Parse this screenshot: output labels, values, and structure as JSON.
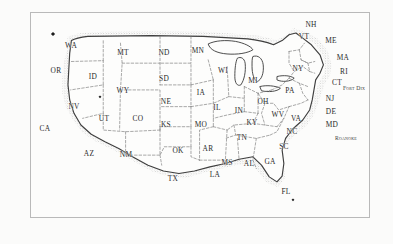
{
  "figure": {
    "kind": "map",
    "region": "Contiguous United States",
    "style": "pen-and-ink stippled coastline with dashed state borders",
    "background_color": "#fbfbfa",
    "frame_color": "#b9b9b9",
    "ink_color": "#2b2b2b",
    "coast_color": "#4a4a4a"
  },
  "states": [
    {
      "abbr": "WA",
      "x": 70,
      "y": 45
    },
    {
      "abbr": "OR",
      "x": 55,
      "y": 70
    },
    {
      "abbr": "ID",
      "x": 92,
      "y": 76
    },
    {
      "abbr": "MT",
      "x": 122,
      "y": 52
    },
    {
      "abbr": "ND",
      "x": 163,
      "y": 52
    },
    {
      "abbr": "MN",
      "x": 197,
      "y": 50
    },
    {
      "abbr": "SD",
      "x": 163,
      "y": 78
    },
    {
      "abbr": "WY",
      "x": 122,
      "y": 90
    },
    {
      "abbr": "NV",
      "x": 73,
      "y": 106
    },
    {
      "abbr": "UT",
      "x": 103,
      "y": 118
    },
    {
      "abbr": "CO",
      "x": 137,
      "y": 118
    },
    {
      "abbr": "NE",
      "x": 165,
      "y": 101
    },
    {
      "abbr": "IA",
      "x": 200,
      "y": 92
    },
    {
      "abbr": "WI",
      "x": 222,
      "y": 70
    },
    {
      "abbr": "MI",
      "x": 252,
      "y": 80
    },
    {
      "abbr": "IL",
      "x": 216,
      "y": 107
    },
    {
      "abbr": "IN",
      "x": 238,
      "y": 110
    },
    {
      "abbr": "OH",
      "x": 262,
      "y": 101
    },
    {
      "abbr": "KS",
      "x": 165,
      "y": 124
    },
    {
      "abbr": "MO",
      "x": 200,
      "y": 124
    },
    {
      "abbr": "KY",
      "x": 251,
      "y": 122
    },
    {
      "abbr": "WV",
      "x": 277,
      "y": 114
    },
    {
      "abbr": "VA",
      "x": 295,
      "y": 118
    },
    {
      "abbr": "CA",
      "x": 44,
      "y": 128
    },
    {
      "abbr": "AZ",
      "x": 88,
      "y": 153
    },
    {
      "abbr": "NM",
      "x": 125,
      "y": 154
    },
    {
      "abbr": "OK",
      "x": 177,
      "y": 150
    },
    {
      "abbr": "AR",
      "x": 207,
      "y": 148
    },
    {
      "abbr": "TN",
      "x": 241,
      "y": 137
    },
    {
      "abbr": "NC",
      "x": 291,
      "y": 131
    },
    {
      "abbr": "SC",
      "x": 283,
      "y": 146
    },
    {
      "abbr": "MS",
      "x": 226,
      "y": 162
    },
    {
      "abbr": "AL",
      "x": 248,
      "y": 163
    },
    {
      "abbr": "GA",
      "x": 269,
      "y": 161
    },
    {
      "abbr": "LA",
      "x": 214,
      "y": 174
    },
    {
      "abbr": "TX",
      "x": 172,
      "y": 178
    },
    {
      "abbr": "FL",
      "x": 285,
      "y": 191
    },
    {
      "abbr": "PA",
      "x": 289,
      "y": 90
    },
    {
      "abbr": "NY",
      "x": 297,
      "y": 68
    },
    {
      "abbr": "VT",
      "x": 303,
      "y": 36
    },
    {
      "abbr": "NH",
      "x": 310,
      "y": 24
    },
    {
      "abbr": "ME",
      "x": 330,
      "y": 40
    },
    {
      "abbr": "MA",
      "x": 342,
      "y": 57
    },
    {
      "abbr": "RI",
      "x": 343,
      "y": 71
    },
    {
      "abbr": "CT",
      "x": 336,
      "y": 82
    },
    {
      "abbr": "NJ",
      "x": 329,
      "y": 98
    },
    {
      "abbr": "DE",
      "x": 330,
      "y": 111
    },
    {
      "abbr": "MD",
      "x": 331,
      "y": 124
    }
  ],
  "annotations": [
    {
      "label": "Fort Dix",
      "x": 353,
      "y": 88
    },
    {
      "label": "Roanoke",
      "x": 345,
      "y": 138
    }
  ],
  "markers": [
    {
      "name": "puget-sound-marker",
      "x": 52,
      "y": 33,
      "size": "normal"
    },
    {
      "name": "great-basin-marker",
      "x": 99,
      "y": 96,
      "size": "small"
    },
    {
      "name": "florida-marker",
      "x": 292,
      "y": 199,
      "size": "small"
    }
  ]
}
